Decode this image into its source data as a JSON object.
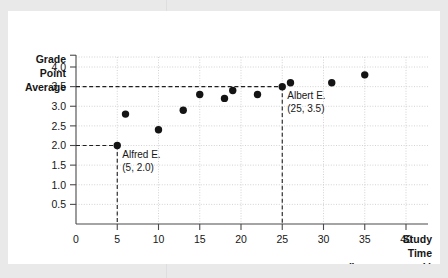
{
  "chart_data": {
    "type": "scatter",
    "title": "",
    "xlabel": "Study Time (hours per week)",
    "ylabel": "Grade Point Average",
    "xlim": [
      0,
      42
    ],
    "ylim": [
      0,
      4.35
    ],
    "grid": true,
    "legend": "none",
    "x_ticks": [
      "0",
      "5",
      "10",
      "15",
      "20",
      "25",
      "30",
      "35",
      "40"
    ],
    "x_tick_values": [
      0,
      5,
      10,
      15,
      20,
      25,
      30,
      35,
      40
    ],
    "y_ticks": [
      "0.5",
      "1.0",
      "1.5",
      "2.0",
      "2.5",
      "3.0",
      "3.5",
      "4.0"
    ],
    "y_tick_values": [
      0.5,
      1.0,
      1.5,
      2.0,
      2.5,
      3.0,
      3.5,
      4.0
    ],
    "points": [
      {
        "x": 5,
        "y": 2.0
      },
      {
        "x": 6,
        "y": 2.8
      },
      {
        "x": 10,
        "y": 2.4
      },
      {
        "x": 13,
        "y": 2.9
      },
      {
        "x": 15,
        "y": 3.3
      },
      {
        "x": 18,
        "y": 3.2
      },
      {
        "x": 19,
        "y": 3.4
      },
      {
        "x": 22,
        "y": 3.3
      },
      {
        "x": 25,
        "y": 3.5
      },
      {
        "x": 26,
        "y": 3.6
      },
      {
        "x": 31,
        "y": 3.6
      },
      {
        "x": 35,
        "y": 3.8
      }
    ],
    "annotations": [
      {
        "name": "Alfred E.",
        "coords": "(5, 2.0)",
        "x": 5,
        "y": 2.0
      },
      {
        "name": "Albert E.",
        "coords": "(25, 3.5)",
        "x": 25,
        "y": 3.5
      }
    ],
    "guides": [
      {
        "x": 5,
        "y": 2.0
      },
      {
        "x": 25,
        "y": 3.5
      }
    ]
  },
  "axes": {
    "y_title_lines": [
      "Grade",
      "Point",
      "Average"
    ],
    "x_title_lines": [
      "Study",
      "Time",
      "(hours per week)"
    ]
  },
  "colors": {
    "page_background": "#e9e9ea",
    "card_background": "#ffffff",
    "axis": "#4a4a4a",
    "grid": "#c8c8c8",
    "dot": "#141414",
    "guide": "#1f1f1f",
    "text": "#161616"
  }
}
